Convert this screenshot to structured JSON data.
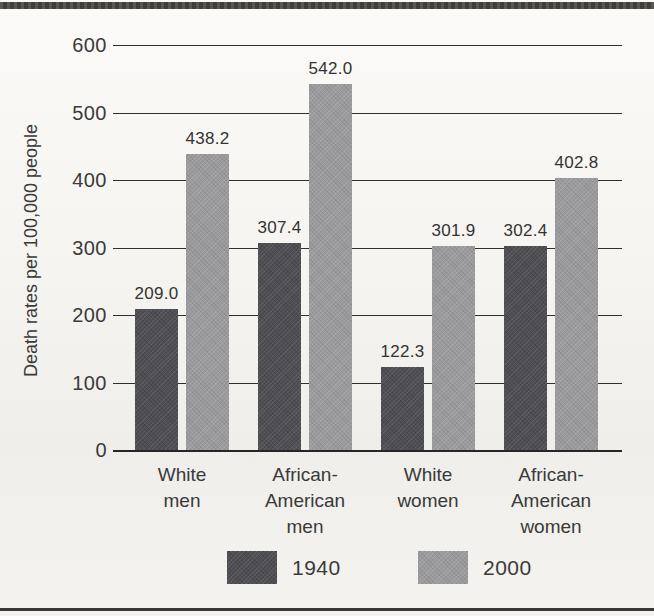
{
  "chart_data": {
    "type": "bar",
    "categories": [
      "White men",
      "African-American men",
      "White women",
      "African-American women"
    ],
    "category_lines": [
      [
        "White",
        "men"
      ],
      [
        "African-",
        "American",
        "men"
      ],
      [
        "White",
        "women"
      ],
      [
        "African-",
        "American",
        "women"
      ]
    ],
    "series": [
      {
        "name": "1940",
        "color": "#4f4f53",
        "values": [
          209.0,
          307.4,
          122.3,
          302.4
        ]
      },
      {
        "name": "2000",
        "color": "#9b9a9c",
        "values": [
          438.2,
          542.0,
          301.9,
          402.8
        ]
      }
    ],
    "title": "",
    "xlabel": "",
    "ylabel": "Death rates per 100,000 people",
    "ylim": [
      0,
      600
    ],
    "yticks": [
      0,
      100,
      200,
      300,
      400,
      500,
      600
    ],
    "value_labels": true,
    "value_label_decimals": 1,
    "grid": true,
    "legend_position": "bottom"
  },
  "colors": {
    "grid": "#2f2f2f",
    "text": "#3a3a3a",
    "top_rule": "#45443f",
    "bottom_rule": "#38383a"
  }
}
